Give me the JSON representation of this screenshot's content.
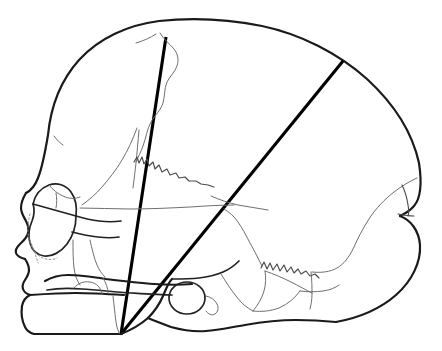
{
  "figure": {
    "title": "Lateral view line drawing of a neonatal skull with two cranial measurement lines",
    "background_color": "#ffffff",
    "outline_color": "#1a1a1a",
    "suture_color": "#6f6f6f",
    "measurement_line_color": "#000000",
    "width_px": 442,
    "height_px": 351
  },
  "measurements": {
    "vertex_point": {
      "label": "common origin point",
      "x": 121,
      "y": 334
    },
    "lines": [
      {
        "id": "line-anterior",
        "label": "anterior measurement line",
        "from": {
          "x": 121,
          "y": 334
        },
        "to": {
          "x": 166,
          "y": 37
        },
        "description": "near-vertical line from chin region to anterior vault"
      },
      {
        "id": "line-oblique",
        "label": "oblique measurement line",
        "from": {
          "x": 121,
          "y": 334
        },
        "to": {
          "x": 343,
          "y": 61
        },
        "description": "oblique line from chin region to posterior-superior vault"
      }
    ]
  },
  "anatomy": {
    "regions": [
      {
        "id": "cranial-vault",
        "label": "cranial vault"
      },
      {
        "id": "frontal-bone",
        "label": "frontal bone"
      },
      {
        "id": "parietal-bone",
        "label": "parietal bone"
      },
      {
        "id": "occipital-bone",
        "label": "occipital bone"
      },
      {
        "id": "temporal-bone",
        "label": "temporal bone"
      },
      {
        "id": "sphenoid-greater-wing",
        "label": "greater wing of sphenoid"
      },
      {
        "id": "orbit",
        "label": "orbit"
      },
      {
        "id": "nasal-region",
        "label": "nasal region"
      },
      {
        "id": "maxilla",
        "label": "maxilla"
      },
      {
        "id": "mandible",
        "label": "mandible"
      },
      {
        "id": "zygomatic-arch",
        "label": "zygomatic arch"
      },
      {
        "id": "external-acoustic-meatus",
        "label": "external acoustic meatus"
      },
      {
        "id": "mastoid-region",
        "label": "mastoid region"
      }
    ],
    "sutures": [
      {
        "id": "coronal-suture",
        "label": "coronal suture"
      },
      {
        "id": "squamosal-suture",
        "label": "squamosal suture"
      },
      {
        "id": "lambdoid-suture",
        "label": "lambdoid suture"
      }
    ]
  }
}
